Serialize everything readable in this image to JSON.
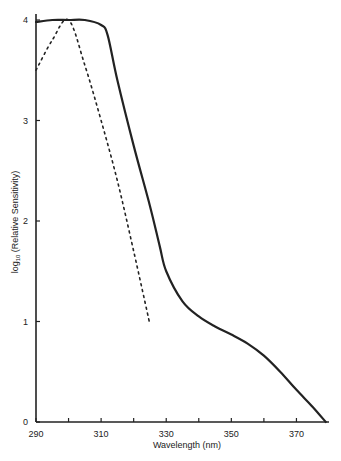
{
  "chart_data": {
    "type": "line",
    "title": "",
    "xlabel": "Wavelength (nm)",
    "ylabel": "log10 (Relative Sensitivity)",
    "xlim": [
      290,
      380
    ],
    "ylim": [
      0,
      4
    ],
    "x_ticks": [
      290,
      300,
      310,
      320,
      330,
      340,
      350,
      360,
      370
    ],
    "x_tick_labels": [
      "290",
      "310",
      "330",
      "350",
      "370"
    ],
    "y_ticks": [
      0,
      1,
      2,
      3,
      4
    ],
    "y_tick_labels": [
      "0",
      "1",
      "2",
      "3",
      "4"
    ],
    "grid": false,
    "legend": null,
    "series": [
      {
        "name": "solid curve",
        "style": "solid",
        "x": [
          290,
          295,
          300,
          305,
          310,
          312,
          315,
          320,
          325,
          328,
          330,
          335,
          340,
          345,
          350,
          355,
          360,
          365,
          370,
          375,
          379
        ],
        "y": [
          3.98,
          4.0,
          4.0,
          4.0,
          3.95,
          3.85,
          3.4,
          2.75,
          2.15,
          1.75,
          1.5,
          1.2,
          1.05,
          0.95,
          0.87,
          0.78,
          0.66,
          0.5,
          0.32,
          0.15,
          0.0
        ]
      },
      {
        "name": "dashed curve",
        "style": "dashed",
        "x": [
          290,
          295,
          300,
          305,
          310,
          315,
          320,
          325
        ],
        "y": [
          3.5,
          3.8,
          4.0,
          3.55,
          3.0,
          2.4,
          1.7,
          0.97
        ]
      }
    ]
  }
}
